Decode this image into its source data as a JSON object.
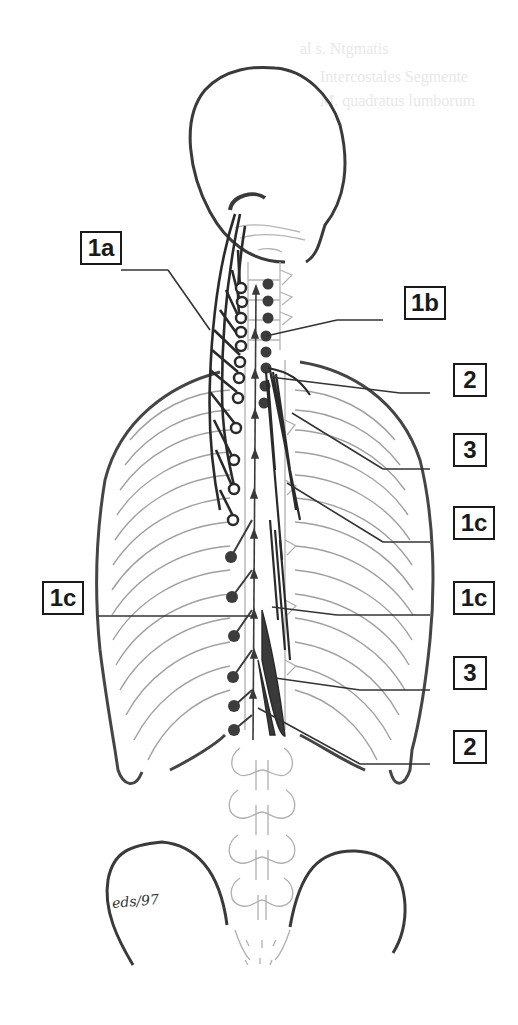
{
  "figure": {
    "type": "anatomical-illustration",
    "signature": "eds/97",
    "bleed_through_text": [
      "al s. Ntgmatis",
      "Intercostales Segmente",
      "M. quadratus lumborum"
    ]
  },
  "labels": [
    {
      "id": "1a",
      "text": "1a",
      "side": "left",
      "x": 80,
      "y": 231,
      "w": 42
    },
    {
      "id": "1b",
      "text": "1b",
      "side": "right",
      "x": 404,
      "y": 286,
      "w": 42
    },
    {
      "id": "2",
      "text": "2",
      "side": "right",
      "x": 453,
      "y": 363,
      "w": 34
    },
    {
      "id": "3",
      "text": "3",
      "side": "right",
      "x": 453,
      "y": 433,
      "w": 34
    },
    {
      "id": "1c-upper",
      "text": "1c",
      "side": "right",
      "x": 453,
      "y": 506,
      "w": 42
    },
    {
      "id": "1c-left",
      "text": "1c",
      "side": "left",
      "x": 42,
      "y": 581,
      "w": 42
    },
    {
      "id": "1c-lower",
      "text": "1c",
      "side": "right",
      "x": 453,
      "y": 581,
      "w": 42
    },
    {
      "id": "3-lower",
      "text": "3",
      "side": "right",
      "x": 453,
      "y": 656,
      "w": 34
    },
    {
      "id": "2-lower",
      "text": "2",
      "side": "right",
      "x": 453,
      "y": 730,
      "w": 34
    }
  ],
  "colors": {
    "outline": "#3a3a3a",
    "ribs": "#9a9a9a",
    "muscle": "#2a2a2a",
    "ganglion_filled": "#3c3c3c",
    "background": "#ffffff"
  }
}
